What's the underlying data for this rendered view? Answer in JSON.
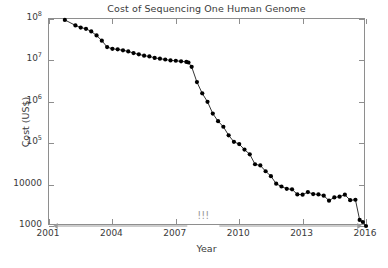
{
  "chart_data": {
    "type": "line",
    "title": "Cost of Sequencing One Human Genome",
    "xlabel": "Year",
    "ylabel": "Cost (US$)",
    "yscale": "log",
    "xlim": [
      2001,
      2016
    ],
    "ylim": [
      1000,
      100000000
    ],
    "grid": false,
    "legend": null,
    "marker": "filled-circle",
    "marker_color": "#000000",
    "line_color": "#000000",
    "axis_color": "#8e8e8e",
    "annotation_color": "#9a9a9a",
    "xticks": [
      2001,
      2004,
      2007,
      2010,
      2013,
      2016
    ],
    "xtick_labels": [
      "2001",
      "2004",
      "2007",
      "2010",
      "2013",
      "2016"
    ],
    "yticks": [
      1000,
      10000,
      100000,
      1000000,
      10000000,
      100000000
    ],
    "ytick_labels": [
      "1000",
      "10000",
      "10^5",
      "10^6",
      "10^7",
      "10^8"
    ],
    "ytick_label_parts": [
      {
        "base": "1000",
        "exp": ""
      },
      {
        "base": "10000",
        "exp": ""
      },
      {
        "base": "10",
        "exp": "5"
      },
      {
        "base": "10",
        "exp": "6"
      },
      {
        "base": "10",
        "exp": "7"
      },
      {
        "base": "10",
        "exp": "8"
      }
    ],
    "annotations": [
      {
        "name": "exclamation-annotation",
        "text": "!!!",
        "x": 2008.3,
        "y": 1000,
        "arrow": "double-headed",
        "arrow_from": 2001.2,
        "arrow_to": 2015.8
      }
    ],
    "x": [
      2001.75,
      2002.25,
      2002.5,
      2002.75,
      2003.0,
      2003.25,
      2003.5,
      2003.75,
      2004.0,
      2004.25,
      2004.5,
      2004.75,
      2005.0,
      2005.25,
      2005.5,
      2005.75,
      2006.0,
      2006.25,
      2006.5,
      2006.75,
      2007.0,
      2007.25,
      2007.5,
      2007.6,
      2007.75,
      2008.0,
      2008.25,
      2008.5,
      2008.75,
      2009.0,
      2009.25,
      2009.5,
      2009.75,
      2010.0,
      2010.25,
      2010.5,
      2010.75,
      2011.0,
      2011.25,
      2011.5,
      2011.75,
      2012.0,
      2012.25,
      2012.5,
      2012.75,
      2013.0,
      2013.25,
      2013.5,
      2013.75,
      2014.0,
      2014.25,
      2014.5,
      2014.75,
      2015.0,
      2015.25,
      2015.5,
      2015.7,
      2015.85,
      2016.0
    ],
    "y": [
      95000000,
      70000000,
      62000000,
      58000000,
      50000000,
      40000000,
      30000000,
      21000000,
      19000000,
      18500000,
      17500000,
      16500000,
      15000000,
      14000000,
      13000000,
      12500000,
      11500000,
      11000000,
      10500000,
      10000000,
      9800000,
      9500000,
      9200000,
      8900000,
      7000000,
      3000000,
      1600000,
      1000000,
      520000,
      340000,
      250000,
      155000,
      108000,
      95000,
      70000,
      54000,
      31000,
      29000,
      21000,
      16000,
      10500,
      9000,
      7900,
      7700,
      5800,
      5700,
      6600,
      5900,
      5800,
      5400,
      4100,
      4900,
      5100,
      5700,
      4200,
      4300,
      1400,
      1250,
      1000
    ]
  }
}
